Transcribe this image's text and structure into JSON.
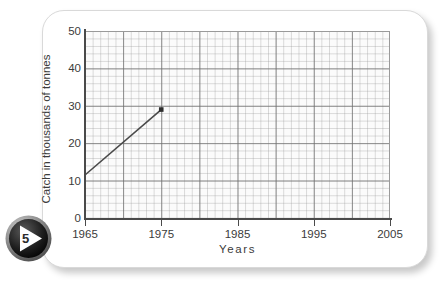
{
  "badge": {
    "number": "5",
    "play_icon": "play-triangle-icon"
  },
  "chart_data": {
    "type": "line",
    "title": "",
    "xlabel": "Years",
    "ylabel": "Catch in thousands of tonnes",
    "xlim": [
      1965,
      2005
    ],
    "ylim": [
      0,
      50
    ],
    "xticks": [
      1965,
      1975,
      1985,
      1995,
      2005
    ],
    "yticks": [
      0,
      10,
      20,
      30,
      40,
      50
    ],
    "xtick_labels": [
      "1965",
      "1975",
      "1985",
      "1995",
      "2005"
    ],
    "ytick_labels": [
      "0",
      "10",
      "20",
      "30",
      "40",
      "50"
    ],
    "grid": true,
    "grid_minor": true,
    "legend": false,
    "series": [
      {
        "name": "Catch",
        "x": [
          1965,
          1975
        ],
        "values": [
          11.5,
          29
        ],
        "marker": "square",
        "marker_at": [
          1975
        ],
        "color": "#4a4a4a"
      }
    ],
    "annotations": []
  }
}
